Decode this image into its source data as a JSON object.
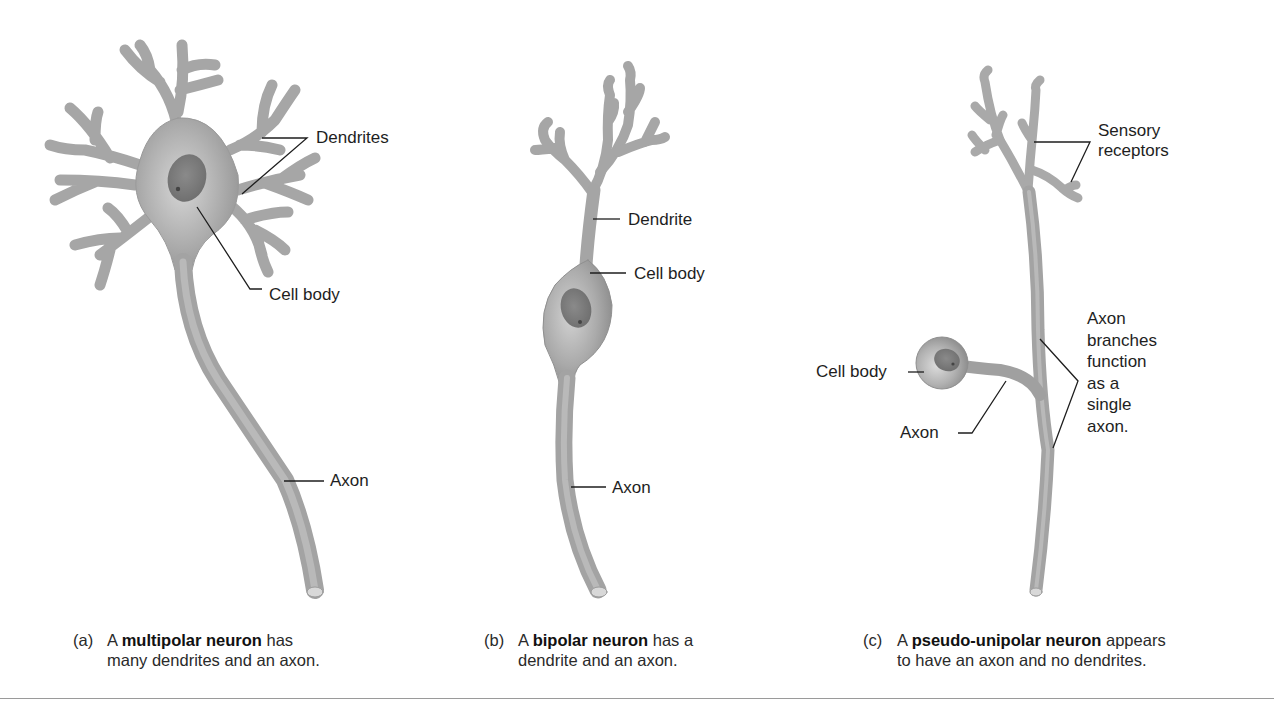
{
  "figure": {
    "panels": [
      {
        "id": "a",
        "letter": "(a)",
        "caption_pre": "A ",
        "caption_bold": "multipolar neuron",
        "caption_post": " has",
        "caption_line2": "many dendrites and an axon.",
        "labels": {
          "dendrites": "Dendrites",
          "cell_body": "Cell body",
          "axon": "Axon"
        }
      },
      {
        "id": "b",
        "letter": "(b)",
        "caption_pre": "A ",
        "caption_bold": "bipolar neuron",
        "caption_post": " has a",
        "caption_line2": "dendrite and an axon.",
        "labels": {
          "dendrite": "Dendrite",
          "cell_body": "Cell body",
          "axon": "Axon"
        }
      },
      {
        "id": "c",
        "letter": "(c)",
        "caption_pre": "A ",
        "caption_bold": "pseudo-unipolar neuron",
        "caption_post": " appears",
        "caption_line2": "to have an axon and no dendrites.",
        "labels": {
          "sensory_receptors_1": "Sensory",
          "sensory_receptors_2": "receptors",
          "cell_body": "Cell body",
          "axon": "Axon",
          "axon_branches": [
            "Axon",
            "branches",
            "function",
            "as a",
            "single",
            "axon."
          ]
        }
      }
    ],
    "colors": {
      "neuron_fill": "#a9a9a9",
      "neuron_dark": "#8e8e8e",
      "nucleus": "#7d7d7d",
      "leader_line": "#1e1e1e",
      "rule": "#9a9a9a"
    }
  }
}
